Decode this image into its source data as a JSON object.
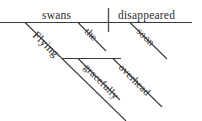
{
  "diagram": {
    "type": "reed-kellogg-sentence-diagram",
    "sentence": "Flying swans gracefully disappeared overhead soon the",
    "ink_color": "#3a3a3a",
    "text_color": "#2b2b2b",
    "background_color": "#ffffff",
    "width": 202,
    "height": 121,
    "words": {
      "subject": "swans",
      "predicate": "disappeared",
      "subject_article": "the",
      "predicate_adverb_time": "soon",
      "subject_participle": "Flying",
      "participle_adverb_manner": "gracefully",
      "predicate_adverb_place": "overhead"
    },
    "baselines": {
      "main_label": "main baseline",
      "participial_label": "participial baseline"
    }
  }
}
